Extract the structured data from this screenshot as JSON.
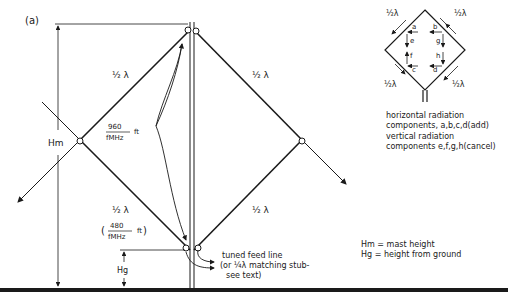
{
  "figure": {
    "panel_label": "(a)",
    "element_labels": {
      "upper_left": "½ λ",
      "upper_right": "½ λ",
      "lower_left": "½ λ",
      "lower_right": "½ λ"
    },
    "formula_full_wave": {
      "numerator": "960",
      "denominator": "fMHz",
      "unit": "ft"
    },
    "formula_half_wave": {
      "open": "(",
      "numerator": "480",
      "denominator": "fMHz",
      "unit": "ft",
      "close": ")"
    },
    "dimension_labels": {
      "mast": "Hm",
      "ground": "Hg"
    },
    "feed_note": [
      "tuned feed line",
      "(or ¼λ matching stub-",
      "see text)"
    ]
  },
  "inset": {
    "side_labels": [
      "½λ",
      "½λ",
      "½λ",
      "½λ"
    ],
    "component_labels": {
      "a": "a",
      "b": "b",
      "c": "c",
      "d": "d",
      "e": "e",
      "f": "f",
      "g": "g",
      "h": "h"
    },
    "caption": [
      "horizontal radiation",
      "components, a,b,c,d(add)",
      "vertical radiation",
      "components e,f,g,h(cancel)"
    ]
  },
  "legend": [
    "Hm = mast height",
    "Hg = height from ground"
  ]
}
